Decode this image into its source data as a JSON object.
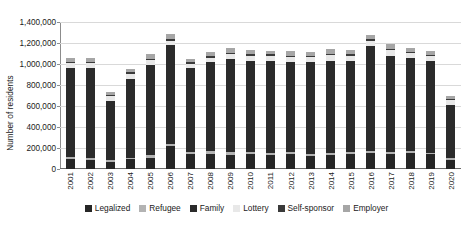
{
  "chart_data": {
    "type": "bar",
    "stacked": true,
    "title": "",
    "subtitle": "",
    "xlabel": "",
    "ylabel": "Number of residents",
    "ylim": [
      0,
      1400000
    ],
    "ytick_values": [
      0,
      200000,
      400000,
      600000,
      800000,
      1000000,
      1200000,
      1400000
    ],
    "ytick_labels": [
      "0",
      "200,000",
      "400,000",
      "600,000",
      "800,000",
      "1,000,000",
      "1,200,000",
      "1,400,000"
    ],
    "grid": "horizontal",
    "legend_position": "bottom",
    "categories": [
      "2001",
      "2002",
      "2003",
      "2004",
      "2005",
      "2006",
      "2007",
      "2008",
      "2009",
      "2010",
      "2011",
      "2012",
      "2013",
      "2014",
      "2015",
      "2016",
      "2017",
      "2018",
      "2019",
      "2020"
    ],
    "series": [
      {
        "name": "Legalized",
        "color": "#262626",
        "values": [
          95000,
          90000,
          70000,
          92000,
          105000,
          220000,
          140000,
          145000,
          135000,
          140000,
          135000,
          145000,
          125000,
          135000,
          140000,
          150000,
          145000,
          150000,
          140000,
          85000
        ]
      },
      {
        "name": "Refugee",
        "color": "#b3b3b3",
        "values": [
          20000,
          18000,
          14000,
          17000,
          26000,
          22000,
          20000,
          22000,
          25000,
          20000,
          18000,
          19000,
          21000,
          22000,
          20000,
          22000,
          20000,
          18000,
          14000,
          16000
        ]
      },
      {
        "name": "Family",
        "color": "#2b2b2b",
        "values": [
          850000,
          858000,
          566000,
          748000,
          860000,
          938000,
          800000,
          853000,
          885000,
          868000,
          873000,
          851000,
          870000,
          875000,
          870000,
          998000,
          915000,
          890000,
          872000,
          510000
        ]
      },
      {
        "name": "Lottery",
        "color": "#e8e8e8",
        "values": [
          42000,
          42000,
          44000,
          50000,
          46000,
          44000,
          42000,
          41000,
          48000,
          49000,
          50000,
          50000,
          48000,
          52000,
          47000,
          49000,
          51000,
          46000,
          46000,
          42000
        ]
      },
      {
        "name": "Self-sponsor",
        "color": "#3a3a3a",
        "values": [
          14000,
          14000,
          12000,
          13000,
          15000,
          15000,
          14000,
          15000,
          16000,
          15000,
          15000,
          16000,
          15000,
          16000,
          16000,
          17000,
          16000,
          15000,
          15000,
          12000
        ]
      },
      {
        "name": "Employer",
        "color": "#a6a6a6",
        "values": [
          36000,
          34000,
          24000,
          31000,
          46000,
          46000,
          36000,
          38000,
          41000,
          38000,
          37000,
          39000,
          36000,
          40000,
          39000,
          42000,
          40000,
          38000,
          38000,
          30000
        ]
      }
    ],
    "totals": [
      1057000,
      1056000,
      730000,
      951000,
      1098000,
      1285000,
      1052000,
      1114000,
      1150000,
      1130000,
      1128000,
      1120000,
      1115000,
      1140000,
      1132000,
      1278000,
      1187000,
      1157000,
      1125000,
      695000
    ]
  },
  "axis": {
    "y_title": "Number of residents"
  },
  "legend": {
    "items": [
      {
        "label": "Legalized",
        "color": "#262626"
      },
      {
        "label": "Refugee",
        "color": "#b3b3b3"
      },
      {
        "label": "Family",
        "color": "#2b2b2b"
      },
      {
        "label": "Lottery",
        "color": "#e8e8e8"
      },
      {
        "label": "Self-sponsor",
        "color": "#3a3a3a"
      },
      {
        "label": "Employer",
        "color": "#a6a6a6"
      }
    ]
  }
}
